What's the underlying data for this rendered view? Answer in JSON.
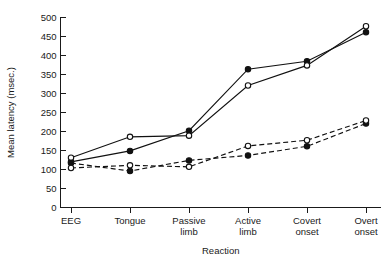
{
  "chart_data": {
    "type": "line",
    "title": "",
    "subtitle": "",
    "xlabel": "Reaction",
    "ylabel": "Mean latency (msec.)",
    "categories": [
      "EEG",
      "Tongue",
      "Passive limb",
      "Active limb",
      "Covert onset",
      "Overt onset"
    ],
    "category_lines": [
      [
        "EEG"
      ],
      [
        "Tongue"
      ],
      [
        "Passive",
        "limb"
      ],
      [
        "Active",
        "limb"
      ],
      [
        "Covert",
        "onset"
      ],
      [
        "Overt",
        "onset"
      ]
    ],
    "ylim": [
      0,
      500
    ],
    "yticks": [
      0,
      50,
      100,
      150,
      200,
      250,
      300,
      350,
      400,
      450,
      500
    ],
    "ytick_labels": [
      "0",
      "50",
      "100",
      "150",
      "200",
      "250",
      "300",
      "350",
      "400",
      "450",
      "500"
    ],
    "grid": false,
    "legend": "none",
    "series": [
      {
        "name": "solid-filled",
        "line_style": "solid",
        "marker": "filled-circle",
        "values": [
          120,
          149,
          202,
          364,
          385,
          461
        ]
      },
      {
        "name": "solid-open",
        "line_style": "solid",
        "marker": "open-circle",
        "values": [
          131,
          186,
          189,
          321,
          374,
          477
        ]
      },
      {
        "name": "dashed-filled",
        "line_style": "dashed",
        "marker": "filled-circle",
        "values": [
          117,
          96,
          124,
          137,
          161,
          221
        ]
      },
      {
        "name": "dashed-open",
        "line_style": "dashed",
        "marker": "open-circle",
        "values": [
          104,
          111,
          107,
          162,
          177,
          229
        ]
      }
    ],
    "colors": {
      "axis": "#1a1a1a",
      "line": "#111111",
      "marker_fill_open": "#ffffff",
      "marker_fill_solid": "#111111",
      "background": "#ffffff"
    }
  }
}
